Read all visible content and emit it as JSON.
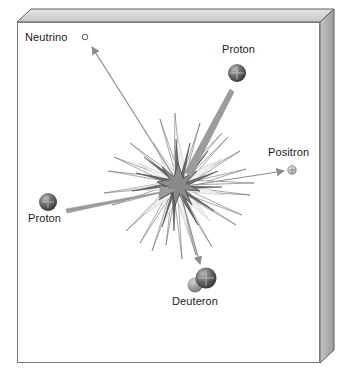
{
  "diagram": {
    "background_color": "#ffffff",
    "frame": {
      "face_fill": "#ffffff",
      "face_stroke": "#7a7a7a",
      "slab_right_fill": "#b0b0b0",
      "slab_top_fill": "#d8d8d8",
      "slab_edge_stroke": "#5a5a5a",
      "depth_px": 14
    },
    "burst": {
      "center_x": 178,
      "center_y": 185,
      "outer_color": "#ffffff",
      "outer_stroke": "#6e6e6e",
      "mid_color": "#efefef",
      "inner_color": "#8a8a8a",
      "inner_stroke": "#4a4a4a"
    },
    "colors": {
      "text": "#1a1a1a",
      "arrow_thick": "#9a9a9a",
      "arrow_thin": "#8c8c8c",
      "proton_dark": "#4d4d4d",
      "proton_light": "#cfcfcf",
      "neutron_light": "#9e9e9e",
      "positron_fill": "#cccccc"
    },
    "particles": [
      {
        "id": "neutrino",
        "label": "Neutrino",
        "kind": "neutrino",
        "cx": 85,
        "cy": 37,
        "r": 3,
        "role": "product"
      },
      {
        "id": "proton-top",
        "label": "Proton",
        "kind": "proton",
        "cx": 237,
        "cy": 73,
        "r": 9,
        "role": "reactant"
      },
      {
        "id": "positron",
        "label": "Positron",
        "kind": "positron",
        "cx": 292,
        "cy": 170,
        "r": 4,
        "role": "product"
      },
      {
        "id": "proton-left",
        "label": "Proton",
        "kind": "proton",
        "cx": 48,
        "cy": 202,
        "r": 9,
        "role": "reactant"
      },
      {
        "id": "deuteron",
        "label": "Deuteron",
        "kind": "deuteron",
        "cx": 202,
        "cy": 281,
        "r": 11,
        "role": "product"
      }
    ],
    "arrows": [
      {
        "id": "arrow-to-neutrino",
        "from": "burst-center",
        "to": "neutrino",
        "style": "thin",
        "x1": 178,
        "y1": 183,
        "x2": 90,
        "y2": 46
      },
      {
        "id": "arrow-from-proton-top",
        "from": "proton-top",
        "to": "burst-center",
        "style": "thick",
        "x1": 232,
        "y1": 94,
        "x2": 186,
        "y2": 176
      },
      {
        "id": "arrow-to-positron",
        "from": "burst-center",
        "to": "positron",
        "style": "thin",
        "x1": 180,
        "y1": 186,
        "x2": 286,
        "y2": 171
      },
      {
        "id": "arrow-from-proton-left",
        "from": "proton-left",
        "to": "burst-center",
        "style": "thick",
        "x1": 68,
        "y1": 207,
        "x2": 172,
        "y2": 190
      },
      {
        "id": "arrow-to-deuteron",
        "from": "burst-center",
        "to": "deuteron",
        "style": "thin",
        "x1": 180,
        "y1": 190,
        "x2": 200,
        "y2": 265
      }
    ]
  }
}
